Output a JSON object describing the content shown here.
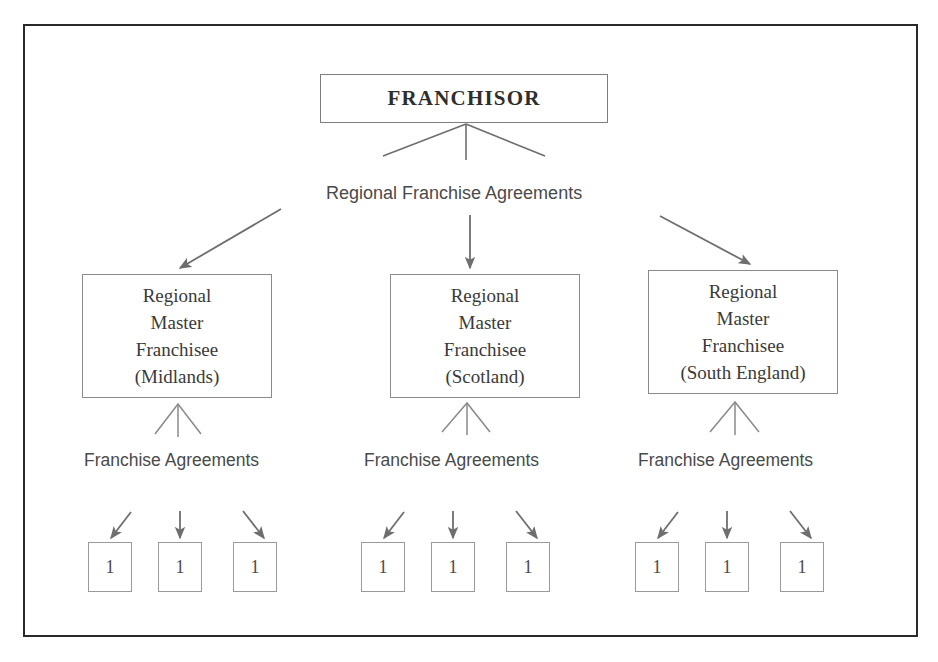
{
  "diagram": {
    "title_node": {
      "label": "FRANCHISOR"
    },
    "tier1_connector_label": "Regional Franchise Agreements",
    "regional_nodes": [
      {
        "line1": "Regional",
        "line2": "Master",
        "line3": "Franchisee",
        "line4": "(Midlands)",
        "text": "Regional\nMaster\nFranchisee\n(Midlands)"
      },
      {
        "line1": "Regional",
        "line2": "Master",
        "line3": "Franchisee",
        "line4": "(Scotland)",
        "text": "Regional\nMaster\nFranchisee\n(Scotland)"
      },
      {
        "line1": "Regional",
        "line2": "Master",
        "line3": "Franchisee",
        "line4": "(South England)",
        "text": "Regional\nMaster\nFranchisee\n(South England)"
      }
    ],
    "tier2_connector_labels": [
      "Franchise Agreements",
      "Franchise Agreements",
      "Franchise Agreements"
    ],
    "unit_nodes": [
      {
        "label": "1"
      },
      {
        "label": "1"
      },
      {
        "label": "1"
      },
      {
        "label": "1"
      },
      {
        "label": "1"
      },
      {
        "label": "1"
      },
      {
        "label": "1"
      },
      {
        "label": "1"
      },
      {
        "label": "1"
      }
    ],
    "colors": {
      "frame_border": "#2a2a2a",
      "box_border": "#8a8a8a",
      "arrow": "#6e6e6e",
      "text": "#3a3a3a"
    }
  }
}
